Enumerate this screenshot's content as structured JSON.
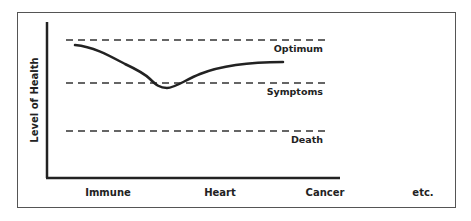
{
  "diagram": {
    "y_axis_label": "Level of Health",
    "levels": [
      {
        "name": "optimum",
        "label": "Optimum",
        "y": 40
      },
      {
        "name": "symptoms",
        "label": "Symptoms",
        "y": 83
      },
      {
        "name": "death",
        "label": "Death",
        "y": 131
      }
    ],
    "x_categories": [
      {
        "label": "Immune",
        "x": 108
      },
      {
        "label": "Heart",
        "x": 220
      },
      {
        "label": "Cancer",
        "x": 325
      },
      {
        "label": "etc.",
        "x": 423
      }
    ],
    "curve_description": "Health curve starting just below Optimum, dipping to Symptoms level near Heart, then recovering toward Optimum",
    "colors": {
      "line": "#222222",
      "frame": "#555555",
      "background": "#ffffff"
    }
  }
}
